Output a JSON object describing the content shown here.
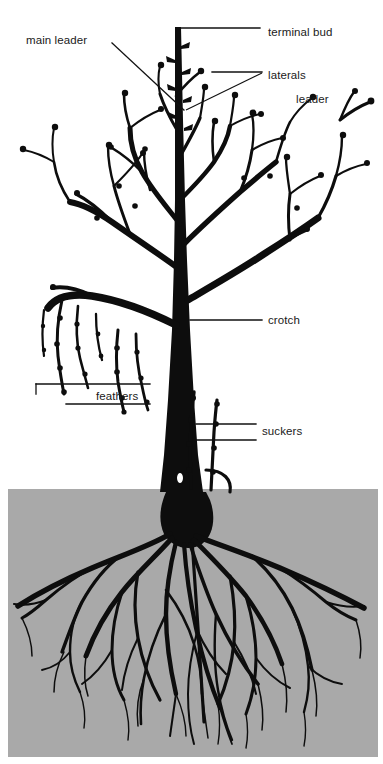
{
  "figure": {
    "type": "botanical-diagram",
    "title_cropped": "",
    "background_color": "#ffffff",
    "ink_color": "#0d0d0d",
    "soil_color": "#a9a9a9"
  },
  "labels": {
    "main_leader": "main leader",
    "terminal_bud": "terminal bud",
    "laterals": "laterals",
    "leader": "leader",
    "crotch": "crotch",
    "feathers": "feathers",
    "suckers": "suckers"
  },
  "label_positions": {
    "main_leader": {
      "x": 26,
      "y": 44,
      "anchor": "start"
    },
    "terminal_bud": {
      "x": 268,
      "y": 36,
      "anchor": "start"
    },
    "laterals": {
      "x": 268,
      "y": 79,
      "anchor": "start"
    },
    "leader": {
      "x": 296,
      "y": 103,
      "anchor": "start"
    },
    "crotch": {
      "x": 268,
      "y": 324,
      "anchor": "start"
    },
    "feathers": {
      "x": 96,
      "y": 400,
      "anchor": "start"
    },
    "suckers": {
      "x": 262,
      "y": 435,
      "anchor": "start"
    }
  },
  "soil_region": {
    "x": 8,
    "y": 489,
    "width": 370,
    "height": 268,
    "note": "gray stippled soil block containing the root system"
  },
  "structure": {
    "trunk_top_y": 27,
    "trunk_bottom_y": 492,
    "trunk_x": 178,
    "ground_line_y": 489,
    "scaffold_branch_count": 6,
    "sucker_count": 2
  }
}
